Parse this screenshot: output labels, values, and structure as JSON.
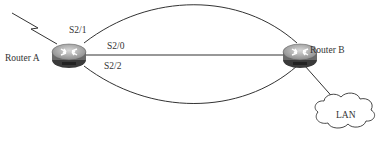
{
  "diagram": {
    "type": "network-topology",
    "nodes": {
      "router_a": {
        "label": "Router A",
        "badge": "ROUTER"
      },
      "router_b": {
        "label": "Router B",
        "badge": "ROUTER"
      },
      "lan": {
        "label": "LAN"
      }
    },
    "interfaces": {
      "s2_1": "S2/1",
      "s2_0": "S2/0",
      "s2_2": "S2/2"
    },
    "links": [
      {
        "from": "Router A",
        "to": "Router B",
        "via": "S2/1",
        "shape": "arc-top"
      },
      {
        "from": "Router A",
        "to": "Router B",
        "via": "S2/0",
        "shape": "straight"
      },
      {
        "from": "Router A",
        "to": "Router B",
        "via": "S2/2",
        "shape": "arc-bottom"
      },
      {
        "from": "Router B",
        "to": "LAN",
        "shape": "straight"
      },
      {
        "from": "Router A",
        "to": "WAN",
        "shape": "lightning"
      }
    ],
    "colors": {
      "router_body": "#8a8a8a",
      "router_top": "#b8b8b8",
      "line": "#333333"
    }
  }
}
